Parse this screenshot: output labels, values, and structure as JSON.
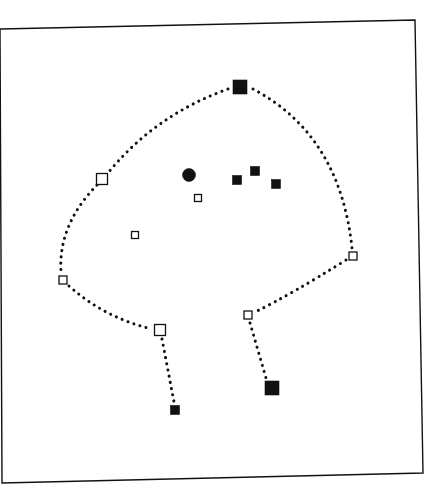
{
  "diagram": {
    "canvas": {
      "width": 445,
      "height": 498
    },
    "colors": {
      "ink": "#111111",
      "paper": "#ffffff"
    },
    "frame": {
      "points": [
        [
          0,
          29
        ],
        [
          415,
          20
        ],
        [
          423,
          473
        ],
        [
          2,
          483
        ]
      ]
    },
    "nodes": [
      {
        "id": "top",
        "shape": "square",
        "fill": "filled",
        "x": 240,
        "y": 87,
        "size": 14
      },
      {
        "id": "upper-left",
        "shape": "square",
        "fill": "open",
        "x": 102,
        "y": 179,
        "size": 11
      },
      {
        "id": "left",
        "shape": "square",
        "fill": "open",
        "x": 63,
        "y": 280,
        "size": 8
      },
      {
        "id": "lower-left",
        "shape": "square",
        "fill": "open",
        "x": 160,
        "y": 330,
        "size": 11
      },
      {
        "id": "foot-left",
        "shape": "square",
        "fill": "filled",
        "x": 175,
        "y": 410,
        "size": 9
      },
      {
        "id": "right",
        "shape": "square",
        "fill": "open",
        "x": 353,
        "y": 256,
        "size": 8
      },
      {
        "id": "lower-right",
        "shape": "square",
        "fill": "open",
        "x": 248,
        "y": 315,
        "size": 8
      },
      {
        "id": "foot-right",
        "shape": "square",
        "fill": "filled",
        "x": 272,
        "y": 388,
        "size": 14
      },
      {
        "id": "inner-open-1",
        "shape": "square",
        "fill": "open",
        "x": 198,
        "y": 198,
        "size": 7
      },
      {
        "id": "inner-open-2",
        "shape": "square",
        "fill": "open",
        "x": 135,
        "y": 235,
        "size": 7
      },
      {
        "id": "inner-dot",
        "shape": "circle",
        "fill": "filled",
        "x": 189,
        "y": 175,
        "size": 13
      },
      {
        "id": "inner-sq-1",
        "shape": "square",
        "fill": "filled",
        "x": 237,
        "y": 180,
        "size": 9
      },
      {
        "id": "inner-sq-2",
        "shape": "square",
        "fill": "filled",
        "x": 255,
        "y": 171,
        "size": 9
      },
      {
        "id": "inner-sq-3",
        "shape": "square",
        "fill": "filled",
        "x": 276,
        "y": 184,
        "size": 9
      }
    ],
    "paths": [
      {
        "id": "top-to-upper-left",
        "d": "M 228 89 Q 155 115 108 173"
      },
      {
        "id": "upper-left-to-left",
        "d": "M 97 185 Q 58 225 61 272"
      },
      {
        "id": "left-to-lower-left",
        "d": "M 69 286 Q 105 318 152 329"
      },
      {
        "id": "lower-left-to-foot-left",
        "d": "M 162 339 L 174 402"
      },
      {
        "id": "top-to-right",
        "d": "M 253 89 Q 340 135 352 248"
      },
      {
        "id": "right-to-lower-right",
        "d": "M 346 260 Q 290 295 255 312"
      },
      {
        "id": "lower-right-to-foot-right",
        "d": "M 250 323 L 266 378"
      }
    ]
  }
}
